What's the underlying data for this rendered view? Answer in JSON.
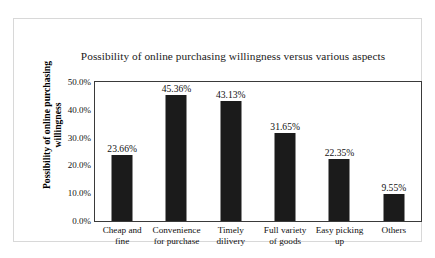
{
  "chart_data": {
    "type": "bar",
    "title": "Possibility of online purchasing willingness versus various aspects",
    "xlabel": "",
    "ylabel": "Possibility of online purchasing willingness",
    "ylim": [
      0,
      50
    ],
    "grid": false,
    "legend": null,
    "ytick_labels": [
      "50.0%",
      "40.0%",
      "30.0%",
      "20.0%",
      "10.0%",
      "0.0%"
    ],
    "ytick_values": [
      50,
      40,
      30,
      20,
      10,
      0
    ],
    "categories": [
      "Cheap and fine",
      "Convenience for purchase",
      "Timely dilivery",
      "Full  variety of goods",
      "Easy picking up",
      "Others"
    ],
    "category_lines": [
      [
        "Cheap and",
        "fine"
      ],
      [
        "Convenience",
        "for purchase"
      ],
      [
        "Timely",
        "dilivery"
      ],
      [
        "Full  variety",
        "of goods"
      ],
      [
        "Easy picking",
        "up"
      ],
      [
        "Others",
        ""
      ]
    ],
    "values": [
      23.66,
      45.36,
      43.13,
      31.65,
      22.35,
      9.55
    ],
    "value_labels": [
      "23.66%",
      "45.36%",
      "43.13%",
      "31.65%",
      "22.35%",
      "9.55%"
    ],
    "bar_color": "#1b1b1b",
    "plot_border_color": "#3a3a3a",
    "background_color": "#ffffff"
  }
}
